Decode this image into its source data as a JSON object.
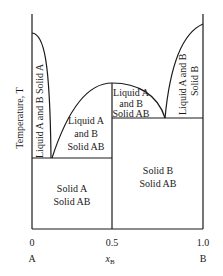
{
  "diagram": {
    "y_axis_label": "Temperature, T",
    "x_axis": {
      "label_main": "x",
      "label_sub": "B",
      "ticks": [
        "0",
        "0.5",
        "1.0"
      ],
      "components": [
        "A",
        "B"
      ]
    },
    "regions": {
      "left_liquid": "Liquid A and B Solid A",
      "mid_left_line1": "Liquid A",
      "mid_left_line2": "and B",
      "mid_left_line3": "Solid AB",
      "top_mid_line1": "Liquid A",
      "top_mid_line2": "and B",
      "top_mid_line3": "Solid AB",
      "right_liquid_line1": "Liquid A and B",
      "right_liquid_line2": "Solid B",
      "bottom_left_line1": "Solid A",
      "bottom_left_line2": "Solid AB",
      "bottom_right_line1": "Solid B",
      "bottom_right_line2": "Solid AB"
    },
    "colors": {
      "line": "#1a1a1a",
      "background": "#ffffff"
    }
  }
}
